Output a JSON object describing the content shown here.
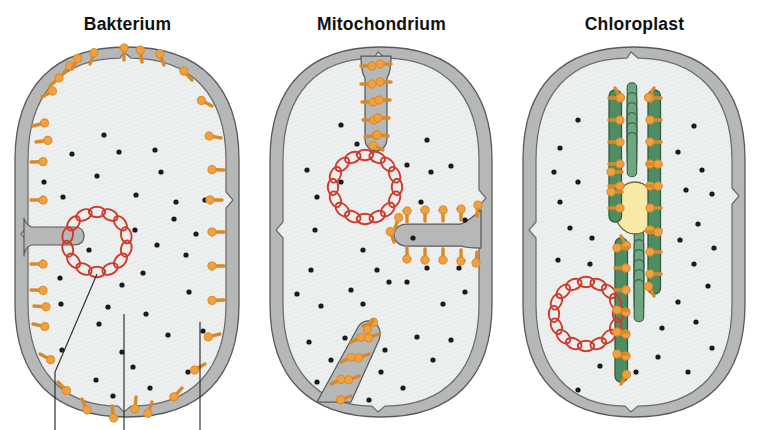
{
  "figure": {
    "background_color": "#ffffff",
    "width": 761,
    "height": 430
  },
  "palette": {
    "membrane_fill": "#b6b7b7",
    "membrane_stroke": "#58595b",
    "cytoplasm_fill": "#eef0f0",
    "cytoplasm_stroke": "#6b6c6e",
    "ribosome_orange": "#f0a03c",
    "ribosome_stroke": "#d98a27",
    "dna_red": "#cf3a2a",
    "thylakoid_green": "#4f8c62",
    "thylakoid_stroke": "#2f5c3e",
    "granum_green": "#6fa57f",
    "starch_yellow": "#f7eaa8",
    "starch_stroke": "#6b6c2e",
    "particle_black": "#1a1a1a",
    "leader_line": "#2b2b2b",
    "title_color": "#111111"
  },
  "panels": [
    {
      "id": "bakterium",
      "title": "Bakterium",
      "x": 0,
      "width": 255,
      "organelle_type": "prokaryotic-cell",
      "features": {
        "has_outer_wall": true,
        "has_dna_ring": true,
        "dna_ring_links": 14,
        "has_mesosome_fold": true,
        "crista_count": 0,
        "thylakoid_stacks": 0,
        "has_starch_granule": false,
        "ribosome_placement": "along-inner-membrane",
        "ribosome_count": 33,
        "particle_count": 34,
        "leader_line_count": 3
      }
    },
    {
      "id": "mitochondrium",
      "title": "Mitochondrium",
      "x": 255,
      "width": 253,
      "organelle_type": "mitochondrion",
      "features": {
        "has_outer_wall": true,
        "has_dna_ring": true,
        "dna_ring_links": 16,
        "has_mesosome_fold": false,
        "crista_count": 3,
        "thylakoid_stacks": 0,
        "has_starch_granule": false,
        "ribosome_placement": "along-cristae",
        "ribosome_count": 33,
        "particle_count": 39,
        "leader_line_count": 0
      }
    },
    {
      "id": "chloroplast",
      "title": "Chloroplast",
      "x": 508,
      "width": 253,
      "organelle_type": "chloroplast",
      "features": {
        "has_outer_wall": true,
        "has_dna_ring": true,
        "dna_ring_links": 16,
        "has_mesosome_fold": false,
        "crista_count": 0,
        "thylakoid_stacks": 2,
        "granum_discs_upper": 6,
        "granum_discs_lower": 6,
        "has_starch_granule": true,
        "ribosome_placement": "along-thylakoid-membranes",
        "ribosome_count": 40,
        "particle_count": 28,
        "leader_line_count": 0
      }
    }
  ],
  "legend_note": "Three membrane-bound compartments compared: a bacterium, a mitochondrion and a chloroplast, each containing a circular DNA ring, ribosomes and internal membrane systems."
}
